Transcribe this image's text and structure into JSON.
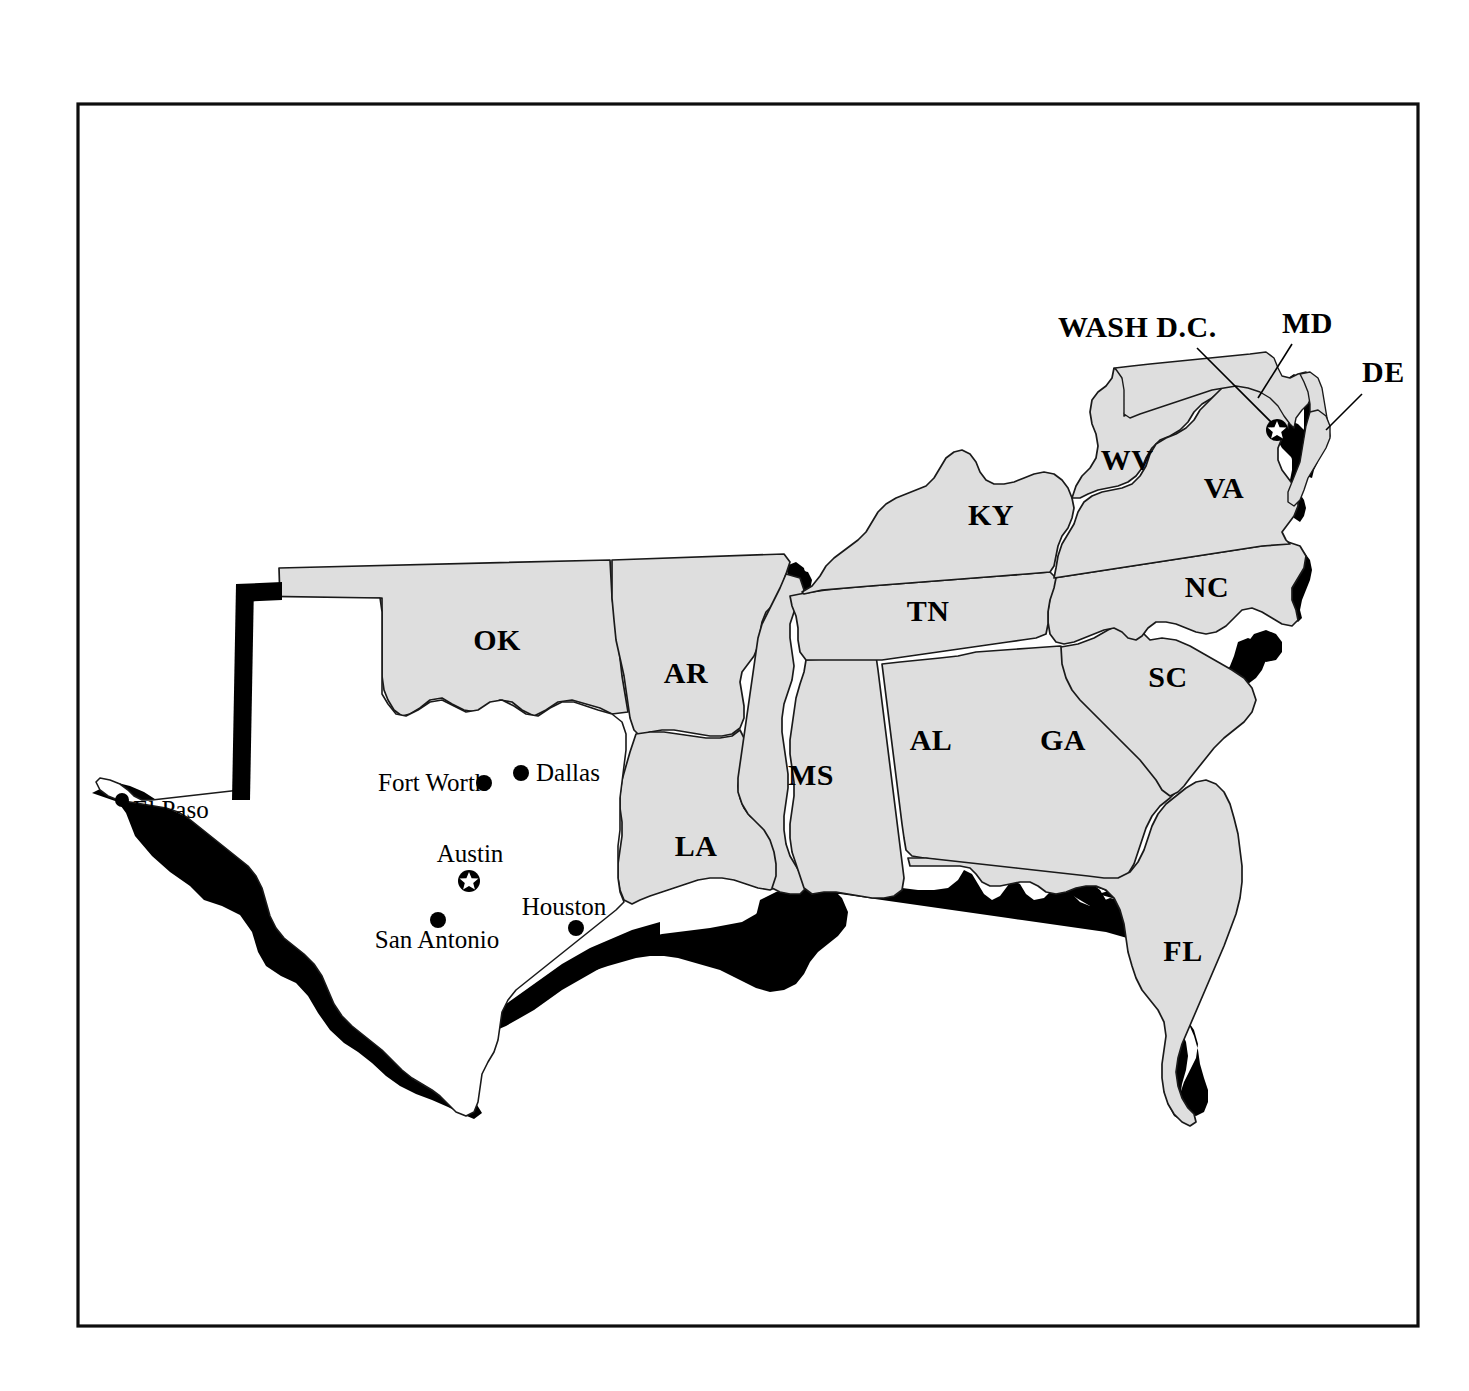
{
  "figure": {
    "frame": {
      "x": 78,
      "y": 104,
      "width": 1340,
      "height": 1222,
      "stroke": "#0d0d0d"
    },
    "colors": {
      "land_fill": "#dedede",
      "water_fill": "#000000",
      "border_stroke": "#1a1a1a",
      "background": "#ffffff",
      "texas_fill": "#ffffff"
    }
  },
  "state_labels": [
    {
      "id": "ok",
      "text": "OK",
      "x": 497,
      "y": 643
    },
    {
      "id": "ar",
      "text": "AR",
      "x": 686,
      "y": 676
    },
    {
      "id": "la",
      "text": "LA",
      "x": 696,
      "y": 849
    },
    {
      "id": "ms",
      "text": "MS",
      "x": 811,
      "y": 778
    },
    {
      "id": "al",
      "text": "AL",
      "x": 931,
      "y": 743
    },
    {
      "id": "ga",
      "text": "GA",
      "x": 1063,
      "y": 743
    },
    {
      "id": "fl",
      "text": "FL",
      "x": 1183,
      "y": 954
    },
    {
      "id": "sc",
      "text": "SC",
      "x": 1168,
      "y": 680
    },
    {
      "id": "nc",
      "text": "NC",
      "x": 1207,
      "y": 590
    },
    {
      "id": "tn",
      "text": "TN",
      "x": 928,
      "y": 614
    },
    {
      "id": "ky",
      "text": "KY",
      "x": 991,
      "y": 518
    },
    {
      "id": "wv",
      "text": "WV",
      "x": 1127,
      "y": 463
    },
    {
      "id": "va",
      "text": "VA",
      "x": 1224,
      "y": 491
    }
  ],
  "callout_labels": [
    {
      "id": "wash-dc",
      "text": "WASH D.C.",
      "text_x": 1058,
      "text_y": 337,
      "leader": {
        "x1": 1197,
        "y1": 348,
        "x2": 1277,
        "y2": 428
      }
    },
    {
      "id": "md",
      "text": "MD",
      "text_x": 1282,
      "text_y": 333,
      "leader": {
        "x1": 1292,
        "y1": 344,
        "x2": 1258,
        "y2": 396
      }
    },
    {
      "id": "de",
      "text": "DE",
      "text_x": 1362,
      "text_y": 382,
      "leader": {
        "x1": 1366,
        "y1": 393,
        "x2": 1330,
        "y2": 428
      }
    }
  ],
  "cities": [
    {
      "id": "fort-worth",
      "name": "Fort Worth",
      "label_x": 378,
      "label_y": 791,
      "anchor": "start",
      "dot_x": 484,
      "dot_y": 783,
      "marker": "dot"
    },
    {
      "id": "dallas",
      "name": "Dallas",
      "label_x": 536,
      "label_y": 781,
      "anchor": "start",
      "dot_x": 521,
      "dot_y": 773,
      "marker": "dot"
    },
    {
      "id": "el-paso",
      "name": "El Paso",
      "label_x": 131,
      "label_y": 818,
      "anchor": "start",
      "dot_x": 122,
      "dot_y": 800,
      "marker": "dot"
    },
    {
      "id": "austin",
      "name": "Austin",
      "label_x": 470,
      "label_y": 862,
      "anchor": "middle",
      "dot_x": 469,
      "dot_y": 881,
      "marker": "star"
    },
    {
      "id": "san-antonio",
      "name": "San Antonio",
      "label_x": 437,
      "label_y": 948,
      "anchor": "middle",
      "dot_x": 438,
      "dot_y": 920,
      "marker": "dot"
    },
    {
      "id": "houston",
      "name": "Houston",
      "label_x": 564,
      "label_y": 915,
      "anchor": "middle",
      "dot_x": 576,
      "dot_y": 928,
      "marker": "dot"
    }
  ]
}
